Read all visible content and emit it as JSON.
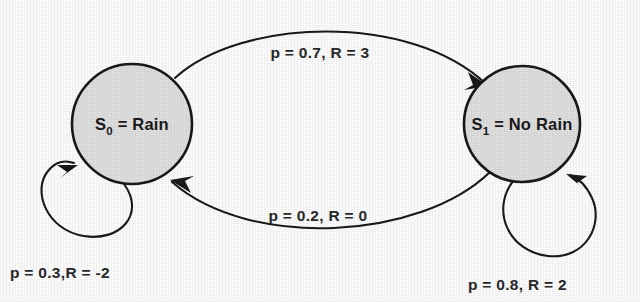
{
  "diagram": {
    "type": "state-transition-diagram",
    "background_color": "#ffffff",
    "node_fill_color": "#e2e2e2",
    "stroke_color": "#1a1a1a"
  },
  "nodes": [
    {
      "id": "S0",
      "state_symbol": "S",
      "state_index": "0",
      "separator": " = ",
      "state_name": "Rain",
      "full_label": "S0 = Rain",
      "cx": 132,
      "cy": 124,
      "r": 60
    },
    {
      "id": "S1",
      "state_symbol": "S",
      "state_index": "1",
      "separator": " = ",
      "state_name": "No Rain",
      "full_label": "S1 = No Rain",
      "cx": 522,
      "cy": 124,
      "r": 58
    }
  ],
  "edges": [
    {
      "id": "s0-to-s1",
      "from": "S0",
      "to": "S1",
      "label": "p = 0.7, R = 3",
      "probability": 0.7,
      "reward": 3,
      "label_x": 320,
      "label_y": 58
    },
    {
      "id": "s1-to-s0",
      "from": "S1",
      "to": "S0",
      "label": "p = 0.2, R = 0",
      "probability": 0.2,
      "reward": 0,
      "label_x": 318,
      "label_y": 221
    },
    {
      "id": "s0-self-loop",
      "from": "S0",
      "to": "S0",
      "label": "p = 0.3,R = -2",
      "probability": 0.3,
      "reward": -2,
      "label_x": 10,
      "label_y": 278
    },
    {
      "id": "s1-self-loop",
      "from": "S1",
      "to": "S1",
      "label": "p = 0.8, R = 2",
      "probability": 0.8,
      "reward": 2,
      "label_x": 468,
      "label_y": 290
    }
  ],
  "icons": {
    "arrow_head": "arrowhead-icon"
  }
}
